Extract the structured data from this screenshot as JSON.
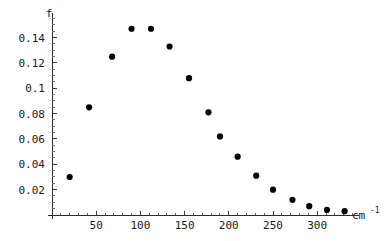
{
  "chart_data": {
    "type": "scatter",
    "title": "",
    "subtitle": "",
    "xlabel": "cm-1",
    "xlabel_base": "cm",
    "xlabel_exponent": "-1",
    "ylabel": "f",
    "xlim": [
      0,
      340
    ],
    "ylim": [
      0,
      0.155
    ],
    "grid": false,
    "legend": false,
    "legend_position": "none",
    "marker": "filled-circle",
    "marker_color": "#000000",
    "marker_size_px": 4.2,
    "x_ticks": [
      50,
      100,
      150,
      200,
      250,
      300
    ],
    "x_tick_labels": [
      "50",
      "100",
      "150",
      "200",
      "250",
      "300"
    ],
    "x_minor_tick_step": 10,
    "y_ticks": [
      0.02,
      0.04,
      0.06,
      0.08,
      0.1,
      0.12,
      0.14
    ],
    "y_tick_labels": [
      "0.02",
      "0.04",
      "0.06",
      "0.08",
      "0.1",
      "0.12",
      "0.14"
    ],
    "y_minor_tick_step": 0.005,
    "x": [
      20,
      42,
      68,
      90,
      112,
      133,
      155,
      177,
      190,
      210,
      231,
      250,
      272,
      291,
      311,
      331
    ],
    "y": [
      0.03,
      0.085,
      0.125,
      0.147,
      0.147,
      0.133,
      0.108,
      0.081,
      0.062,
      0.046,
      0.031,
      0.02,
      0.012,
      0.007,
      0.004,
      0.003
    ],
    "points": [
      {
        "x": 20,
        "y": 0.03
      },
      {
        "x": 42,
        "y": 0.085
      },
      {
        "x": 68,
        "y": 0.125
      },
      {
        "x": 90,
        "y": 0.147
      },
      {
        "x": 112,
        "y": 0.147
      },
      {
        "x": 133,
        "y": 0.133
      },
      {
        "x": 155,
        "y": 0.108
      },
      {
        "x": 177,
        "y": 0.081
      },
      {
        "x": 190,
        "y": 0.062
      },
      {
        "x": 210,
        "y": 0.046
      },
      {
        "x": 231,
        "y": 0.031
      },
      {
        "x": 250,
        "y": 0.02
      },
      {
        "x": 272,
        "y": 0.012
      },
      {
        "x": 291,
        "y": 0.007
      },
      {
        "x": 311,
        "y": 0.004
      },
      {
        "x": 331,
        "y": 0.003
      }
    ]
  },
  "colors": {
    "background": "#ffffff",
    "axis": "#2b2b2b",
    "marker": "#000000",
    "text": "#1a1a1a"
  }
}
